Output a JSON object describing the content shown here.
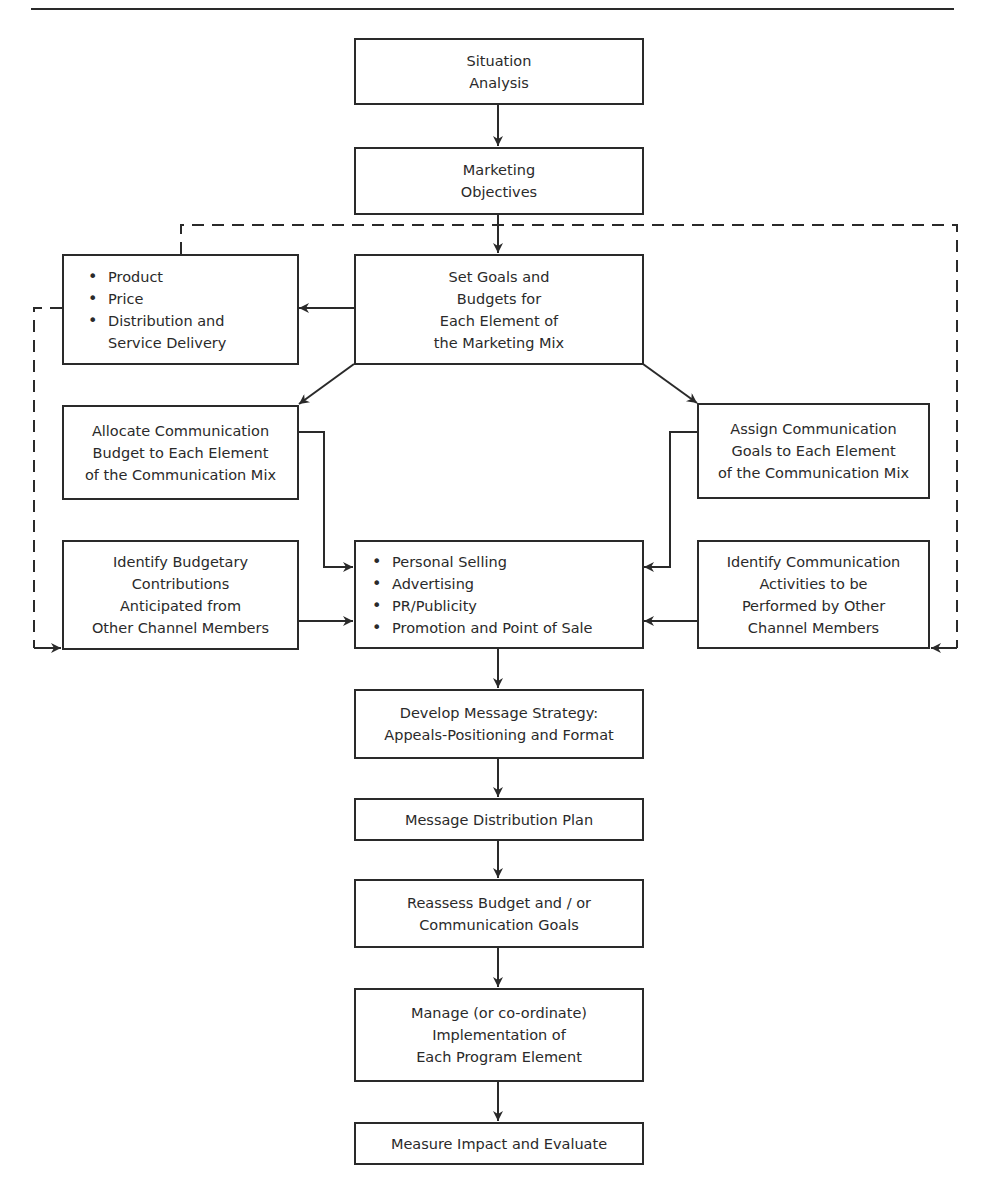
{
  "diagram": {
    "type": "flowchart",
    "colors": {
      "line": "#2a2a2a",
      "background": "#ffffff"
    },
    "boxes": {
      "situation_analysis": {
        "label": "Situation\nAnalysis"
      },
      "marketing_objectives": {
        "label": "Marketing\nObjectives"
      },
      "set_goals": {
        "label": "Set Goals and\nBudgets for\nEach Element of\nthe Marketing Mix"
      },
      "marketing_mix": {
        "items": [
          "Product",
          "Price",
          "Distribution and",
          "Service Delivery"
        ]
      },
      "allocate_budget": {
        "label": "Allocate Communication\nBudget to Each Element\nof the Communication Mix"
      },
      "assign_goals": {
        "label": "Assign Communication\nGoals to Each Element\nof the Communication Mix"
      },
      "identify_budgetary": {
        "label": "Identify Budgetary\nContributions\nAnticipated from\nOther Channel Members"
      },
      "communication_mix": {
        "items": [
          "Personal Selling",
          "Advertising",
          "PR/Publicity",
          "Promotion and Point of Sale"
        ]
      },
      "identify_activities": {
        "label": "Identify Communication\nActivities to be\nPerformed by Other\nChannel Members"
      },
      "message_strategy": {
        "label": "Develop Message Strategy:\nAppeals-Positioning and Format"
      },
      "distribution_plan": {
        "label": "Message Distribution Plan"
      },
      "reassess": {
        "label": "Reassess Budget and / or\nCommunication Goals"
      },
      "manage": {
        "label": "Manage (or co-ordinate)\nImplementation of\nEach Program Element"
      },
      "measure": {
        "label": "Measure Impact and Evaluate"
      }
    },
    "edges": [
      {
        "from": "Situation Analysis",
        "to": "Marketing Objectives",
        "style": "solid"
      },
      {
        "from": "Marketing Objectives",
        "to": "Set Goals and Budgets",
        "style": "solid"
      },
      {
        "from": "Set Goals and Budgets",
        "to": "Product/Price/Distribution",
        "style": "solid"
      },
      {
        "from": "Set Goals and Budgets",
        "to": "Allocate Communication Budget",
        "style": "solid"
      },
      {
        "from": "Set Goals and Budgets",
        "to": "Assign Communication Goals",
        "style": "solid"
      },
      {
        "from": "Allocate Communication Budget",
        "to": "Communication Mix",
        "style": "solid"
      },
      {
        "from": "Assign Communication Goals",
        "to": "Communication Mix",
        "style": "solid"
      },
      {
        "from": "Identify Budgetary Contributions",
        "to": "Communication Mix",
        "style": "solid"
      },
      {
        "from": "Identify Communication Activities",
        "to": "Communication Mix",
        "style": "solid"
      },
      {
        "from": "Product/Price/Distribution",
        "to": "Identify Budgetary Contributions",
        "style": "dashed"
      },
      {
        "from": "Product/Price/Distribution",
        "to": "Identify Communication Activities",
        "style": "dashed"
      },
      {
        "from": "Communication Mix",
        "to": "Develop Message Strategy",
        "style": "solid"
      },
      {
        "from": "Develop Message Strategy",
        "to": "Message Distribution Plan",
        "style": "solid"
      },
      {
        "from": "Message Distribution Plan",
        "to": "Reassess Budget",
        "style": "solid"
      },
      {
        "from": "Reassess Budget",
        "to": "Manage Implementation",
        "style": "solid"
      },
      {
        "from": "Manage Implementation",
        "to": "Measure Impact and Evaluate",
        "style": "solid"
      }
    ]
  }
}
